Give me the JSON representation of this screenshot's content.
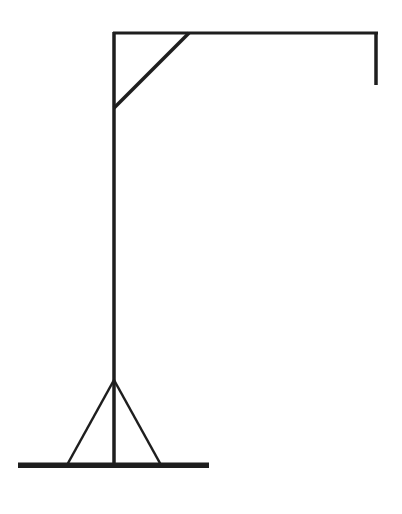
{
  "figure": {
    "stroke_color": "#1e1e1e",
    "background_color": "#ffffff"
  },
  "parts": {
    "top_beam": {
      "x1": 113,
      "y1": 33,
      "x2": 378,
      "y2": 33,
      "width": 3
    },
    "pole": {
      "x1": 114,
      "y1": 32,
      "x2": 114,
      "y2": 466,
      "width": 3.5
    },
    "brace": {
      "x1": 114,
      "y1": 108,
      "x2": 189,
      "y2": 33,
      "width": 3.5
    },
    "rope": {
      "x1": 376,
      "y1": 32,
      "x2": 376,
      "y2": 85,
      "width": 3.5
    },
    "base": {
      "x": 18,
      "y": 462.5,
      "w": 191,
      "h": 5.5
    },
    "left_leg": {
      "x1": 114,
      "y1": 380,
      "x2": 67,
      "y2": 465,
      "width": 2.5
    },
    "right_leg": {
      "x1": 114,
      "y1": 380,
      "x2": 161,
      "y2": 465,
      "width": 2.5
    }
  }
}
